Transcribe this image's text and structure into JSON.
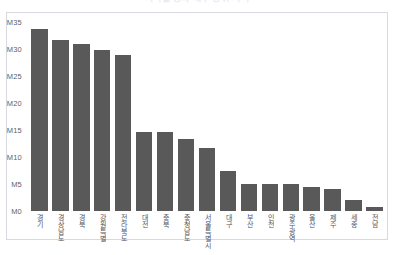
{
  "chart_data": {
    "type": "bar",
    "title": "지역별 등록 대수 상위 지역",
    "xlabel": "",
    "ylabel": "",
    "ylim": [
      0,
      35
    ],
    "ytick_labels": [
      "M35",
      "M30",
      "M25",
      "M20",
      "M15",
      "M10",
      "M5",
      "M0"
    ],
    "ytick_values": [
      35,
      30,
      25,
      20,
      15,
      10,
      5,
      0
    ],
    "grid": false,
    "legend": false,
    "bar_color": "#595959",
    "categories": [
      "경기",
      "경상남도",
      "경북",
      "강원특별",
      "전라북도",
      "대전",
      "충북",
      "충청남도",
      "서울특별시",
      "대구",
      "부산",
      "인천",
      "광주광역",
      "울산",
      "제주",
      "세종",
      "전남"
    ],
    "values": [
      33.7,
      31.6,
      31.0,
      29.8,
      28.8,
      14.7,
      14.7,
      13.4,
      11.6,
      7.5,
      5.0,
      5.0,
      5.0,
      4.5,
      4.0,
      2.0,
      0.8
    ]
  },
  "colors": {
    "bar": "#595959",
    "frame_border": "#d8d8de",
    "tick_text": "#5f5f66",
    "title_text": "#e9e9ee",
    "background": "#ffffff"
  }
}
